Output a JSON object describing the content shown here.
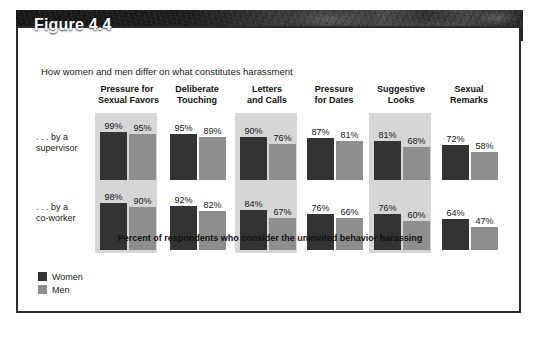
{
  "figure": {
    "title": "Figure 4.4",
    "subtitle": "How women and men differ on what constitutes harassment",
    "baseline_caption": "Percent of respondents who consider the uninvited behavior harassing"
  },
  "legend": {
    "items": [
      {
        "label": "Women",
        "color": "#333333",
        "key": "women"
      },
      {
        "label": "Men",
        "color": "#8e8e8e",
        "key": "men"
      }
    ]
  },
  "rows": [
    {
      "line1": ". . . by a",
      "line2": "supervisor"
    },
    {
      "line1": ". . . by a",
      "line2": "co-worker"
    }
  ],
  "columns": [
    {
      "line1": "Pressure for",
      "line2": "Sexual Favors",
      "shaded": true
    },
    {
      "line1": "Deliberate",
      "line2": "Touching",
      "shaded": false
    },
    {
      "line1": "Letters",
      "line2": "and Calls",
      "shaded": true
    },
    {
      "line1": "Pressure",
      "line2": "for Dates",
      "shaded": false
    },
    {
      "line1": "Suggestive",
      "line2": "Looks",
      "shaded": true
    },
    {
      "line1": "Sexual",
      "line2": "Remarks",
      "shaded": false
    }
  ],
  "values": {
    "supervisor": {
      "women": [
        "99%",
        "95%",
        "90%",
        "87%",
        "81%",
        "72%"
      ],
      "men": [
        "95%",
        "89%",
        "76%",
        "81%",
        "68%",
        "58%"
      ]
    },
    "coworker": {
      "women": [
        "98%",
        "92%",
        "84%",
        "76%",
        "76%",
        "64%"
      ],
      "men": [
        "90%",
        "82%",
        "67%",
        "66%",
        "60%",
        "47%"
      ]
    }
  },
  "chart_data": {
    "type": "bar",
    "title": "Figure 4.4",
    "subtitle": "How women and men differ on what constitutes harassment",
    "xlabel": "",
    "ylabel": "Percent of respondents who consider the uninvited behavior harassing",
    "ylim": [
      0,
      100
    ],
    "grid": false,
    "legend_position": "bottom-left",
    "categories": [
      "Pressure for Sexual Favors",
      "Deliberate Touching",
      "Letters and Calls",
      "Pressure for Dates",
      "Suggestive Looks",
      "Sexual Remarks"
    ],
    "panels": [
      {
        "name": ". . . by a supervisor",
        "series": [
          {
            "name": "Women",
            "values": [
              99,
              95,
              90,
              87,
              81,
              72
            ]
          },
          {
            "name": "Men",
            "values": [
              95,
              89,
              76,
              81,
              68,
              58
            ]
          }
        ]
      },
      {
        "name": ". . . by a co-worker",
        "series": [
          {
            "name": "Women",
            "values": [
              98,
              92,
              84,
              76,
              76,
              64
            ]
          },
          {
            "name": "Men",
            "values": [
              90,
              82,
              67,
              66,
              60,
              47
            ]
          }
        ]
      }
    ],
    "units": "percent"
  }
}
